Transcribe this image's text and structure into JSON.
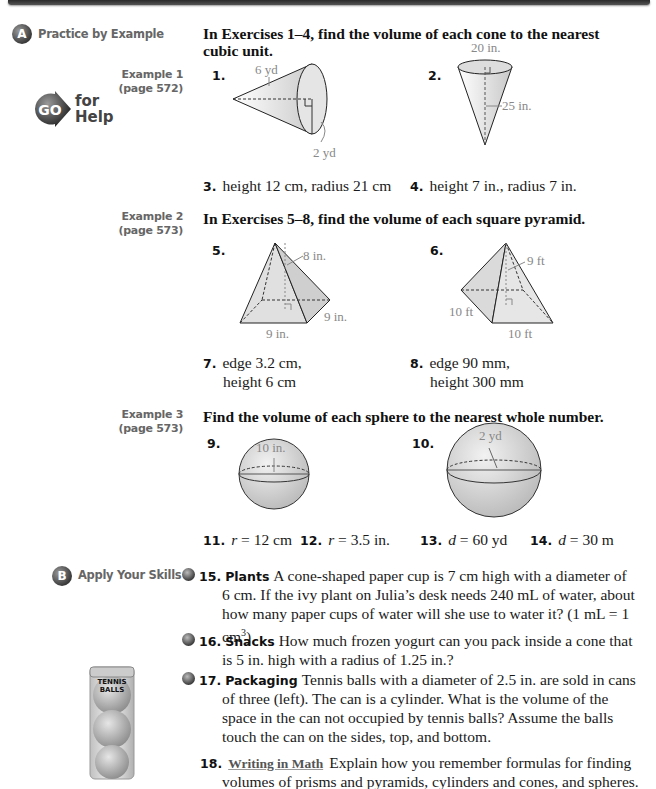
{
  "sections": {
    "a": {
      "badge": "A",
      "label": "Practice by Example"
    },
    "b": {
      "badge": "B",
      "label": "Apply Your Skills"
    }
  },
  "go_for_help": {
    "go": "GO",
    "for": "for",
    "help": "Help"
  },
  "examples": [
    {
      "line1": "Example 1",
      "line2": "(page 572)"
    },
    {
      "line1": "Example 2",
      "line2": "(page 573)"
    },
    {
      "line1": "Example 3",
      "line2": "(page 573)"
    }
  ],
  "instructions": {
    "cones": "In Exercises 1–4, find the volume of each cone to the nearest cubic unit.",
    "pyramids": "In Exercises 5–8, find the volume of each square pyramid.",
    "spheres": "Find the volume of each sphere to the nearest whole number."
  },
  "figures": {
    "ex1": {
      "slant": "6 yd",
      "radius": "2 yd"
    },
    "ex2": {
      "diameter": "20 in.",
      "height": "25 in."
    },
    "ex5": {
      "height": "8 in.",
      "edge_front": "9 in.",
      "edge_side": "9 in."
    },
    "ex6": {
      "height": "9 ft",
      "edge_left": "10 ft",
      "edge_front": "10 ft"
    },
    "ex9": {
      "diameter": "10 in."
    },
    "ex10": {
      "radius": "2 yd"
    }
  },
  "exercises": {
    "e1": "1.",
    "e2": "2.",
    "e3": {
      "num": "3.",
      "text": "height 12 cm, radius 21 cm"
    },
    "e4": {
      "num": "4.",
      "text": "height 7 in., radius 7 in."
    },
    "e5": "5.",
    "e6": "6.",
    "e7": {
      "num": "7.",
      "line1": "edge 3.2 cm,",
      "line2": "height 6 cm"
    },
    "e8": {
      "num": "8.",
      "line1": "edge 90 mm,",
      "line2": "height 300 mm"
    },
    "e9": "9.",
    "e10": "10.",
    "e11": {
      "num": "11.",
      "var": "r",
      "text": " = 12 cm"
    },
    "e12": {
      "num": "12.",
      "var": "r",
      "text": " = 3.5 in."
    },
    "e13": {
      "num": "13.",
      "var": "d",
      "text": " = 60 yd"
    },
    "e14": {
      "num": "14.",
      "var": "d",
      "text": " = 30 m"
    },
    "e15": {
      "num": "15.",
      "keyword": "Plants",
      "line1": "A cone-shaped paper cup is 7 cm high with a diameter of",
      "line2": "6 cm. If the ivy plant on Julia’s desk needs 240 mL of water, about",
      "line3": "how many paper cups of water will she use to water it? (1 mL = 1 cm",
      "sup": "3",
      "close": ")"
    },
    "e16": {
      "num": "16.",
      "keyword": "Snacks",
      "line1": "How much frozen yogurt can you pack inside a cone that",
      "line2": "is 5 in. high with a radius of 1.25 in.?"
    },
    "e17": {
      "num": "17.",
      "keyword": "Packaging",
      "line1": "Tennis balls with a diameter of 2.5 in. are sold in cans",
      "line2": "of three (left). The can is a cylinder. What is the volume of the",
      "line3": "space in the can not occupied by tennis balls? Assume the balls",
      "line4": "touch the can on the sides, top, and bottom."
    },
    "e18": {
      "num": "18.",
      "keyword": "Writing in Math",
      "line1": "Explain how you remember formulas for finding",
      "line2": "volumes of prisms and pyramids, cylinders and cones, and spheres."
    }
  },
  "tennis_can": {
    "label1": "TENNIS",
    "label2": "BALLS"
  }
}
